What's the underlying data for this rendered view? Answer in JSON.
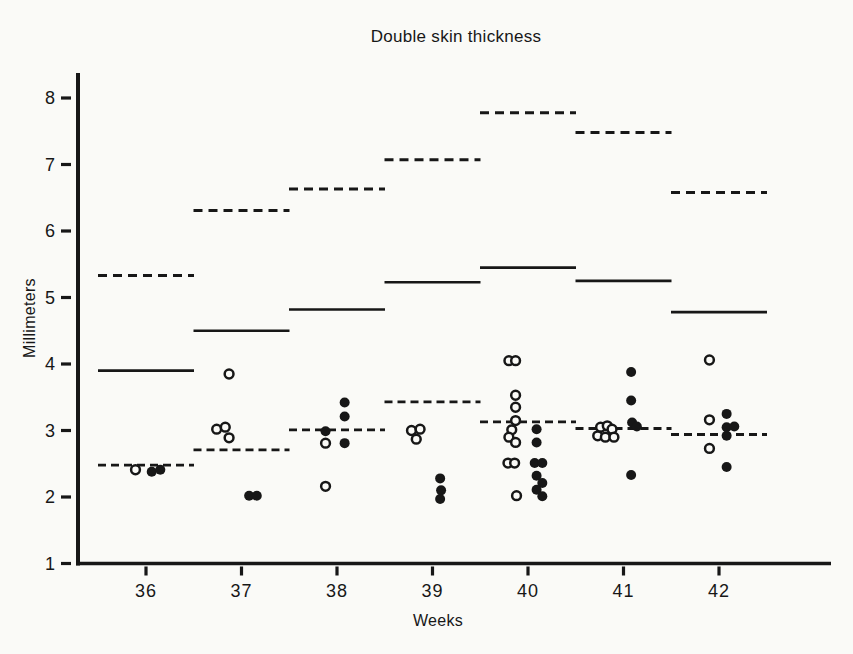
{
  "chart_data": {
    "type": "scatter",
    "title": "Double skin thickness",
    "xlabel": "Weeks",
    "ylabel": "Millimeters",
    "x_ticks": [
      36,
      37,
      38,
      39,
      40,
      41,
      42
    ],
    "y_ticks": [
      8,
      7,
      6,
      5,
      4,
      3,
      2,
      1
    ],
    "xlim": [
      35.5,
      43.1
    ],
    "ylim": [
      1,
      8.4
    ],
    "grid": false,
    "legend": "none",
    "colors": {
      "ink": "#171717",
      "paper": "#fafaf7"
    },
    "marker_styles": [
      "open-circle",
      "filled-circle"
    ],
    "line_styles_per_week": [
      "upper-dashed",
      "solid",
      "lower-dashed"
    ],
    "weeks": [
      {
        "week": 36,
        "dashed_upper": 5.33,
        "solid": 3.9,
        "dashed_lower": 2.48,
        "open_points": [
          [
            35.89,
            2.41
          ]
        ],
        "filled_points": [
          [
            36.06,
            2.38
          ],
          [
            36.15,
            2.41
          ]
        ]
      },
      {
        "week": 37,
        "dashed_upper": 6.31,
        "solid": 4.5,
        "dashed_lower": 2.71,
        "open_points": [
          [
            36.87,
            3.85
          ],
          [
            36.74,
            3.02
          ],
          [
            36.83,
            3.05
          ],
          [
            36.87,
            2.89
          ]
        ],
        "filled_points": [
          [
            37.08,
            2.02
          ],
          [
            37.16,
            2.02
          ]
        ]
      },
      {
        "week": 38,
        "dashed_upper": 6.63,
        "solid": 4.82,
        "dashed_lower": 3.01,
        "open_points": [
          [
            37.88,
            2.81
          ],
          [
            37.88,
            2.16
          ]
        ],
        "filled_points": [
          [
            38.08,
            3.42
          ],
          [
            38.08,
            3.21
          ],
          [
            37.88,
            2.99
          ],
          [
            38.08,
            2.81
          ]
        ]
      },
      {
        "week": 39,
        "dashed_upper": 7.07,
        "solid": 5.23,
        "dashed_lower": 3.43,
        "open_points": [
          [
            38.78,
            3.0
          ],
          [
            38.87,
            3.02
          ],
          [
            38.83,
            2.87
          ]
        ],
        "filled_points": [
          [
            39.08,
            2.28
          ],
          [
            39.09,
            2.1
          ],
          [
            39.08,
            1.97
          ]
        ]
      },
      {
        "week": 40,
        "dashed_upper": 7.78,
        "solid": 5.45,
        "dashed_lower": 3.13,
        "open_points": [
          [
            39.8,
            4.05
          ],
          [
            39.87,
            4.05
          ],
          [
            39.87,
            3.53
          ],
          [
            39.87,
            3.35
          ],
          [
            39.87,
            3.15
          ],
          [
            39.83,
            3.01
          ],
          [
            39.8,
            2.9
          ],
          [
            39.87,
            2.82
          ],
          [
            39.79,
            2.51
          ],
          [
            39.86,
            2.51
          ],
          [
            39.88,
            2.02
          ]
        ],
        "filled_points": [
          [
            40.09,
            3.02
          ],
          [
            40.09,
            2.82
          ],
          [
            40.07,
            2.51
          ],
          [
            40.15,
            2.51
          ],
          [
            40.09,
            2.32
          ],
          [
            40.15,
            2.21
          ],
          [
            40.09,
            2.11
          ],
          [
            40.15,
            2.01
          ]
        ]
      },
      {
        "week": 41,
        "dashed_upper": 7.48,
        "solid": 5.25,
        "dashed_lower": 3.03,
        "open_points": [
          [
            40.76,
            3.05
          ],
          [
            40.83,
            3.07
          ],
          [
            40.88,
            3.02
          ],
          [
            40.73,
            2.92
          ],
          [
            40.81,
            2.9
          ],
          [
            40.9,
            2.9
          ]
        ],
        "filled_points": [
          [
            41.08,
            3.88
          ],
          [
            41.08,
            3.45
          ],
          [
            41.09,
            3.12
          ],
          [
            41.14,
            3.06
          ],
          [
            41.08,
            2.33
          ]
        ]
      },
      {
        "week": 42,
        "dashed_upper": 6.58,
        "solid": 4.78,
        "dashed_lower": 2.94,
        "open_points": [
          [
            41.9,
            4.06
          ],
          [
            41.9,
            3.16
          ],
          [
            41.9,
            2.73
          ]
        ],
        "filled_points": [
          [
            42.08,
            3.25
          ],
          [
            42.08,
            3.05
          ],
          [
            42.16,
            3.06
          ],
          [
            42.08,
            2.92
          ],
          [
            42.08,
            2.45
          ]
        ]
      }
    ]
  }
}
